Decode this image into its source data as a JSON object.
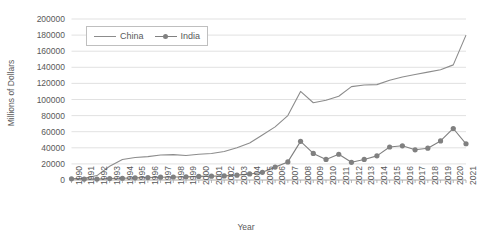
{
  "chart_data": {
    "type": "line",
    "title": "",
    "xlabel": "Year",
    "ylabel": "Millions of Dollars",
    "grid": true,
    "legend_position": "top-left-inside",
    "ylim": [
      0,
      200000
    ],
    "ytick_labels": [
      "0",
      "20000",
      "40000",
      "60000",
      "80000",
      "100000",
      "120000",
      "140000",
      "160000",
      "180000",
      "200000"
    ],
    "yticks": [
      0,
      20000,
      40000,
      60000,
      80000,
      100000,
      120000,
      140000,
      160000,
      180000,
      200000
    ],
    "categories": [
      "1990",
      "1991",
      "1992",
      "1993",
      "1994",
      "1995",
      "1996",
      "1997",
      "1998",
      "1999",
      "2000",
      "2001",
      "2002",
      "2003",
      "2004",
      "2005",
      "2006",
      "2007",
      "2008",
      "2009",
      "2010",
      "2011",
      "2012",
      "2013",
      "2014",
      "2015",
      "2016",
      "2017",
      "2018",
      "2019",
      "2020",
      "2021"
    ],
    "series": [
      {
        "name": "China",
        "color": "#8c8c8c",
        "marker": "none",
        "values": [
          1500,
          2000,
          5500,
          17000,
          25500,
          28000,
          29000,
          31000,
          31500,
          30500,
          32000,
          33000,
          35500,
          40000,
          46000,
          56000,
          66000,
          80000,
          110000,
          96000,
          99000,
          104000,
          116000,
          118000,
          118500,
          124000,
          128000,
          131000,
          134000,
          137000,
          143000,
          180000
        ]
      },
      {
        "name": "India",
        "color": "#808080",
        "marker": "circle",
        "values": [
          1500,
          1200,
          1100,
          1800,
          2200,
          2700,
          3100,
          3500,
          3700,
          3900,
          4500,
          4800,
          5100,
          6000,
          7500,
          9500,
          16000,
          22500,
          48000,
          33000,
          25500,
          32000,
          22000,
          25500,
          30000,
          41000,
          42500,
          37500,
          39500,
          48500,
          64000,
          45000
        ]
      }
    ]
  }
}
